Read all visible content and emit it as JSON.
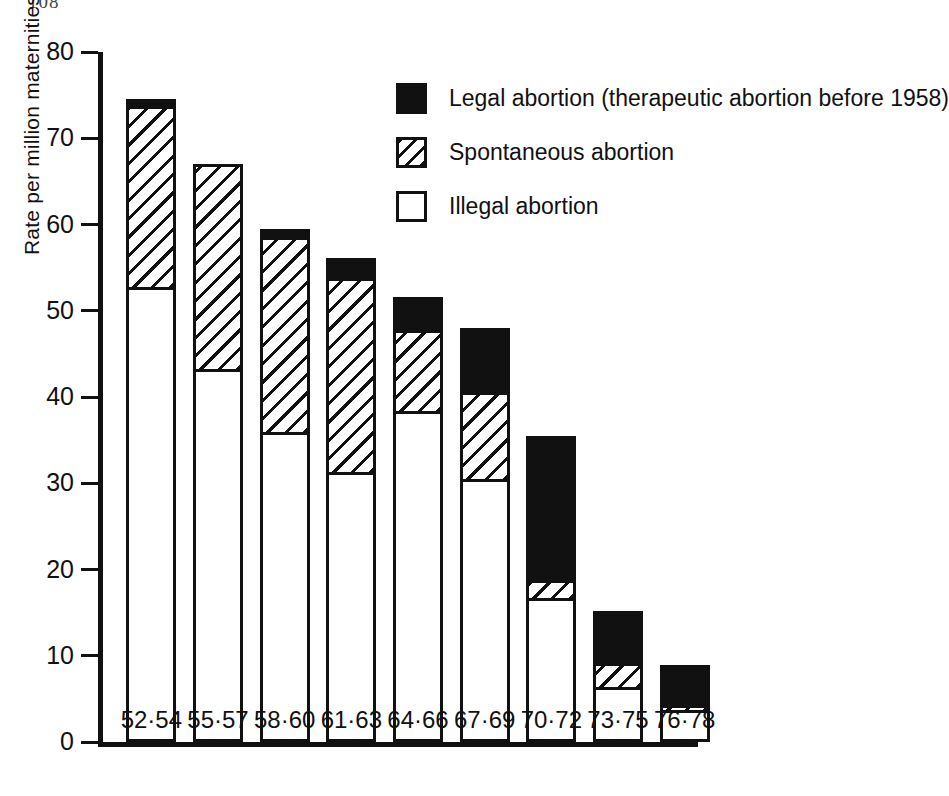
{
  "page_number": "108",
  "chart_data": {
    "type": "bar",
    "subtype": "stacked",
    "title": "",
    "xlabel": "",
    "ylabel": "Rate per million maternities",
    "ylim": [
      0,
      80
    ],
    "yticks": [
      0,
      10,
      20,
      30,
      40,
      50,
      60,
      70,
      80
    ],
    "ytick_labels": [
      "0",
      "10",
      "20",
      "30",
      "40",
      "50",
      "60",
      "70",
      "80"
    ],
    "grid": false,
    "legend_position": "upper-right",
    "categories": [
      "52·54",
      "55·57",
      "58·60",
      "61·63",
      "64·66",
      "67·69",
      "70·72",
      "73·75",
      "76·78"
    ],
    "series": [
      {
        "name": "Illegal abortion",
        "key": "illegal",
        "fill": "white",
        "values": [
          52.4,
          42.9,
          35.6,
          31.0,
          38.0,
          30.1,
          16.3,
          6.0,
          3.4
        ]
      },
      {
        "name": "Spontaneous abortion",
        "key": "spontaneous",
        "fill": "hatched",
        "values": [
          21.3,
          24.1,
          22.9,
          22.8,
          9.8,
          10.5,
          2.5,
          3.2,
          0.9
        ]
      },
      {
        "name": "Legal abortion (therapeutic abortion before 1958)",
        "key": "legal",
        "fill": "black",
        "values": [
          0.8,
          0.0,
          1.0,
          2.3,
          3.8,
          7.4,
          16.7,
          6.0,
          4.6
        ]
      }
    ],
    "totals": [
      74.5,
      67.0,
      59.5,
      56.1,
      51.6,
      48.0,
      35.5,
      15.2,
      8.9
    ]
  },
  "legend": {
    "items": [
      {
        "label": "Legal abortion (therapeutic abortion before 1958)",
        "style": "legal"
      },
      {
        "label": "Spontaneous abortion",
        "style": "spont"
      },
      {
        "label": "Illegal abortion",
        "style": "illegal"
      }
    ]
  }
}
